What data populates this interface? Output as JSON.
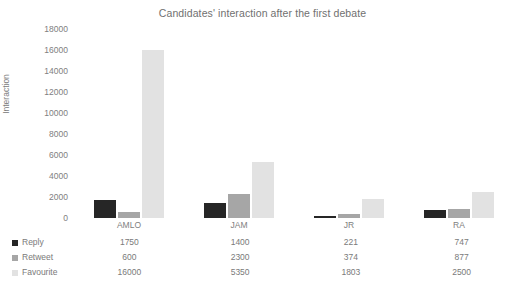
{
  "chart_data": {
    "type": "bar",
    "title": "Candidates' interaction after the first debate",
    "xlabel": "",
    "ylabel": "Interaction",
    "categories": [
      "AMLO",
      "JAM",
      "JR",
      "RA"
    ],
    "series": [
      {
        "name": "Reply",
        "color": "#262626",
        "values": [
          1750,
          1400,
          221,
          747
        ]
      },
      {
        "name": "Retweet",
        "color": "#a6a6a6",
        "values": [
          600,
          2300,
          374,
          877
        ]
      },
      {
        "name": "Favourite",
        "color": "#e2e2e2",
        "values": [
          16000,
          5350,
          1803,
          2500
        ]
      }
    ],
    "ylim": [
      0,
      18000
    ],
    "ytick_step": 2000,
    "yticks": [
      "18000",
      "16000",
      "14000",
      "12000",
      "10000",
      "8000",
      "6000",
      "4000",
      "2000",
      "0"
    ],
    "grid": false,
    "legend_position": "bottom-table",
    "data_table_visible": true
  },
  "chart": {
    "title": "Candidates' interaction after the first debate",
    "y_axis_title": "Interaction"
  },
  "table": {
    "rows": [
      {
        "series_label": "Reply",
        "swatch_color": "#262626",
        "cells": [
          "1750",
          "1400",
          "221",
          "747"
        ]
      },
      {
        "series_label": "Retweet",
        "swatch_color": "#a6a6a6",
        "cells": [
          "600",
          "2300",
          "374",
          "877"
        ]
      },
      {
        "series_label": "Favourite",
        "swatch_color": "#e2e2e2",
        "cells": [
          "16000",
          "5350",
          "1803",
          "2500"
        ]
      }
    ]
  }
}
